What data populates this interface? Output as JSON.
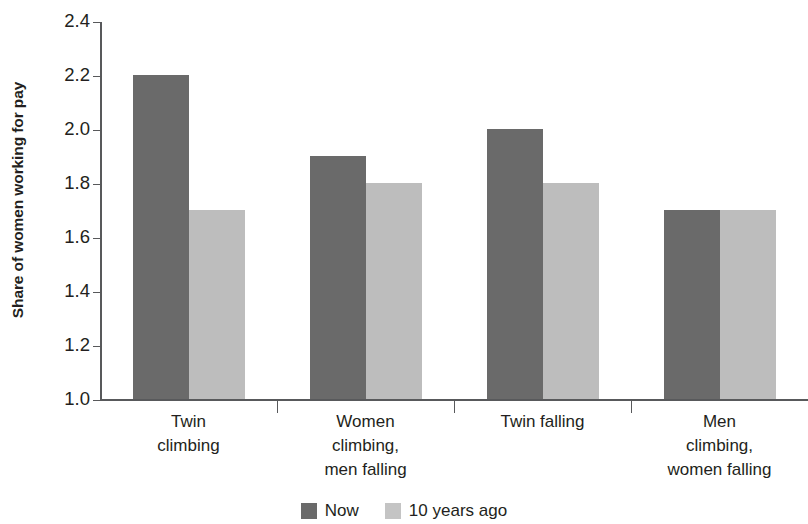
{
  "chart_data": {
    "type": "bar",
    "title": "",
    "xlabel": "",
    "ylabel": "Share of women working for pay",
    "ylim": [
      1.0,
      2.4
    ],
    "yticks": [
      "1.0",
      "1.2",
      "1.4",
      "1.6",
      "1.8",
      "2.0",
      "2.2",
      "2.4"
    ],
    "ytick_values": [
      1.0,
      1.2,
      1.4,
      1.6,
      1.8,
      2.0,
      2.2,
      2.4
    ],
    "grid": false,
    "legend_position": "bottom-center",
    "categories": [
      "Twin climbing",
      "Women climbing, men falling",
      "Twin falling",
      "Men climbing, women falling"
    ],
    "category_lines": [
      [
        "Twin",
        "climbing"
      ],
      [
        "Women",
        "climbing,",
        "men falling"
      ],
      [
        "Twin falling"
      ],
      [
        "Men",
        "climbing,",
        "women falling"
      ]
    ],
    "series": [
      {
        "name": "Now",
        "color": "#6a6a6a",
        "values": [
          2.2,
          1.9,
          2.0,
          1.7
        ]
      },
      {
        "name": "10 years ago",
        "color": "#c4c4c4",
        "values": [
          1.7,
          1.8,
          1.8,
          1.7
        ]
      }
    ]
  },
  "legend": {
    "items": [
      {
        "label": "Now",
        "swatch": "now"
      },
      {
        "label": "10 years ago",
        "swatch": "ago"
      }
    ]
  }
}
